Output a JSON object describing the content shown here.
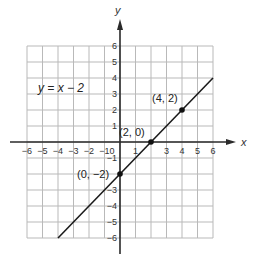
{
  "chart_data": {
    "type": "line",
    "title": "",
    "equation": "y = x − 2",
    "xlabel": "x",
    "ylabel": "y",
    "xlim": [
      -6,
      6
    ],
    "ylim": [
      -6,
      6
    ],
    "grid": true,
    "x_ticks": [
      "−6",
      "−5",
      "−4",
      "−3",
      "−2",
      "−1",
      "0",
      "1",
      "3",
      "4",
      "5",
      "6"
    ],
    "y_ticks": [
      "6",
      "5",
      "4",
      "3",
      "2",
      "1",
      "−1",
      "−3",
      "−4",
      "−5",
      "−6"
    ],
    "series": [
      {
        "name": "y = x − 2",
        "x": [
          -4,
          6
        ],
        "y": [
          -6,
          4
        ]
      }
    ],
    "labeled_points": [
      {
        "x": 0,
        "y": -2,
        "label": "(0, −2)"
      },
      {
        "x": 2,
        "y": 0,
        "label": "(2, 0)"
      },
      {
        "x": 4,
        "y": 2,
        "label": "(4, 2)"
      }
    ]
  }
}
